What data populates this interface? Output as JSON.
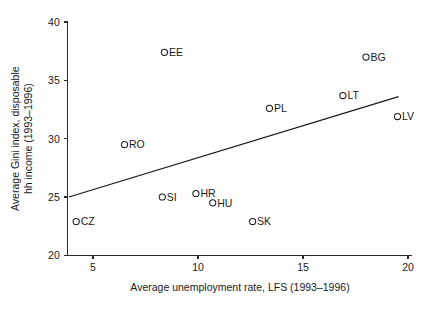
{
  "chart_data": {
    "type": "scatter",
    "title": "",
    "xlabel": "Average unemployment rate, LFS (1993–1996)",
    "ylabel_line1": "Average Gini index, disposable",
    "ylabel_line2": "hh income (1993–1996)",
    "xlim": [
      3.8,
      20.2
    ],
    "ylim": [
      20,
      40
    ],
    "xticks": [
      5,
      10,
      15,
      20
    ],
    "xtick_labels": [
      "5",
      "10",
      "15",
      "20"
    ],
    "yticks": [
      20,
      25,
      30,
      35,
      40
    ],
    "ytick_labels": [
      "20",
      "25",
      "30",
      "35",
      "40"
    ],
    "grid": false,
    "legend": "none",
    "marker_style": "open-circle",
    "points": [
      {
        "label": "CZ",
        "x": 4.2,
        "y": 22.9
      },
      {
        "label": "RO",
        "x": 6.5,
        "y": 29.5
      },
      {
        "label": "SI",
        "x": 8.3,
        "y": 25.0
      },
      {
        "label": "EE",
        "x": 8.4,
        "y": 37.4
      },
      {
        "label": "HR",
        "x": 9.9,
        "y": 25.3
      },
      {
        "label": "HU",
        "x": 10.7,
        "y": 24.5
      },
      {
        "label": "SK",
        "x": 12.6,
        "y": 22.9
      },
      {
        "label": "PL",
        "x": 13.4,
        "y": 32.6
      },
      {
        "label": "LT",
        "x": 16.9,
        "y": 33.7
      },
      {
        "label": "BG",
        "x": 18.0,
        "y": 37.0
      },
      {
        "label": "LV",
        "x": 19.5,
        "y": 31.9
      }
    ],
    "fit_line": {
      "name": "linear fit",
      "x_start": 3.85,
      "y_start": 25.0,
      "x_end": 19.55,
      "y_end": 33.6
    }
  }
}
